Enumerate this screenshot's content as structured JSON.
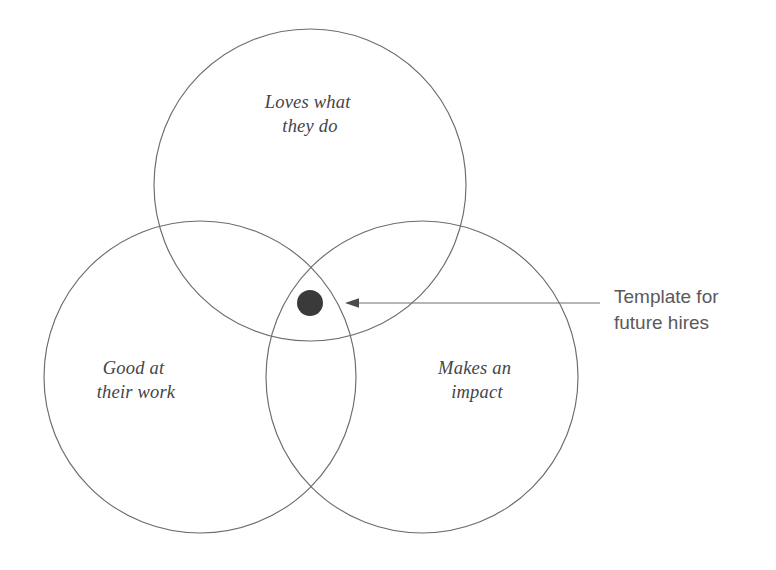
{
  "diagram": {
    "type": "venn-3-circle",
    "background_color": "#ffffff",
    "stroke_color": "#6b6b70",
    "label_color": "#454549",
    "dot_color": "#3a3a3a",
    "annotation_color": "#59595d",
    "circles": [
      {
        "id": "top",
        "label_line1": "Loves what",
        "label_line2": "they do",
        "cx": 310,
        "cy": 185,
        "r": 156
      },
      {
        "id": "left",
        "label_line1": "Good at",
        "label_line2": "their work",
        "cx": 200,
        "cy": 377,
        "r": 156
      },
      {
        "id": "right",
        "label_line1": "Makes an",
        "label_line2": "impact",
        "cx": 422,
        "cy": 377,
        "r": 156
      }
    ],
    "center_marker": {
      "name": "center-dot",
      "cx": 310,
      "cy": 303,
      "r": 13
    },
    "annotation": {
      "line1": "Template for",
      "line2": "future hires",
      "arrow_from_x": 600,
      "arrow_to_x": 345,
      "arrow_y": 303
    }
  }
}
